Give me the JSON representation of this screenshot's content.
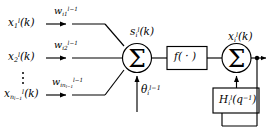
{
  "diagram": {
    "type": "block-diagram",
    "colors": {
      "stroke": "#000000",
      "background": "#ffffff",
      "box_fill": "#ffffff"
    },
    "inputs": [
      {
        "id": "x1",
        "label_base": "x",
        "label_sub": "1",
        "label_sup": "l",
        "label_arg": "(k)",
        "text": "x_1^l(k)"
      },
      {
        "id": "x2",
        "label_base": "x",
        "label_sub": "2",
        "label_sup": "l",
        "label_arg": "(k)",
        "text": "x_2^l(k)"
      },
      {
        "id": "xn",
        "label_base": "x",
        "label_sub": "n_{l-1}",
        "label_sup": "l",
        "label_arg": "(k)",
        "text": "x_{n_{l-1}}^l(k)"
      }
    ],
    "weights": [
      {
        "id": "wi1",
        "label_base": "w",
        "label_sub": "i1",
        "label_sup": "l-1",
        "text": "w_{i1}^{l-1}"
      },
      {
        "id": "wi2",
        "label_base": "w",
        "label_sub": "i2",
        "label_sup": "l-1",
        "text": "w_{i2}^{l-1}"
      },
      {
        "id": "win",
        "label_base": "w",
        "label_sub": "in_{l-1}",
        "label_sup": "l-1",
        "text": "w_{in_{l-1}}^{l-1}"
      }
    ],
    "ellipsis": "vertical-dots",
    "bias": {
      "id": "theta",
      "label_base": "θ",
      "label_sub": "i",
      "label_sup": "l-1",
      "text": "θ_i^{l-1}"
    },
    "nodes": [
      {
        "id": "sum1",
        "shape": "circle",
        "symbol": "Σ",
        "name": "summation-node-input"
      },
      {
        "id": "sum2",
        "shape": "circle",
        "symbol": "Σ",
        "name": "summation-node-output"
      }
    ],
    "blocks": [
      {
        "id": "activation",
        "shape": "rect",
        "label_base": "f",
        "label_arg": "( · )",
        "text": "f( · )",
        "name": "activation-function-block"
      },
      {
        "id": "feedback",
        "shape": "rect",
        "label_base": "H",
        "label_sub": "i",
        "label_sup": "l",
        "label_arg": "(q",
        "label_arg_sup": "-1",
        "label_arg_close": ")",
        "text": "H_i^l(q^{-1})",
        "name": "feedback-filter-block"
      }
    ],
    "signals": [
      {
        "id": "s",
        "label_base": "s",
        "label_sub": "i",
        "label_sup": "l",
        "label_arg": "(k)",
        "text": "s_i^l(k)",
        "name": "net-input-signal-label"
      },
      {
        "id": "xout",
        "label_base": "x",
        "label_sub": "i",
        "label_sup": "l",
        "label_arg": "(k)",
        "text": "x_i^l(k)",
        "name": "output-signal-label"
      }
    ],
    "junction": {
      "id": "tap",
      "shape": "dot",
      "name": "output-tap-junction"
    }
  }
}
